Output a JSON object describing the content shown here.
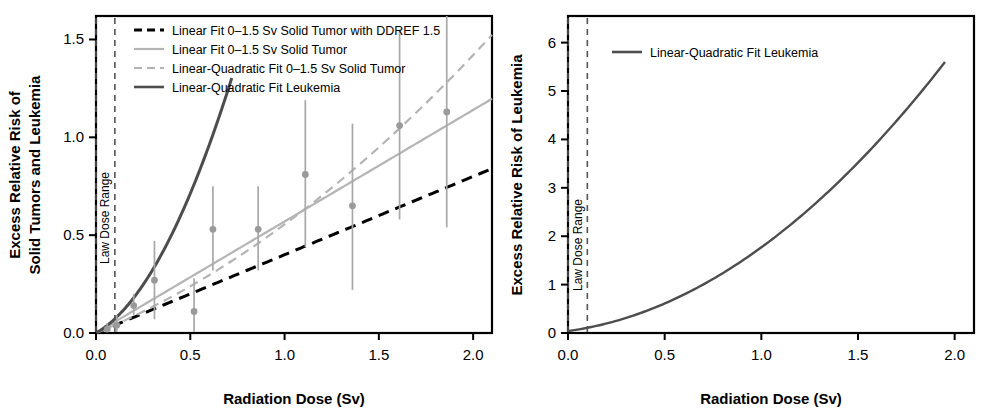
{
  "figure": {
    "width": 992,
    "height": 414,
    "background": "#ffffff",
    "panel_count": 2
  },
  "colors": {
    "axis": "#000000",
    "black_dashed": "#000000",
    "light_gray": "#b4b4b4",
    "dark_gray": "#4d4d4d",
    "point_fill": "#9a9a9a",
    "errorbar": "#a8a8a8",
    "band_dash": "#555555"
  },
  "chart_data": [
    {
      "panel": "left",
      "type": "line",
      "title": "",
      "xlabel": "Radiation Dose (Sv)",
      "ylabel": "Excess Relative Risk of Solid Tumors and Leukemia",
      "ylabel_lines": [
        "Excess Relative Risk of",
        "Solid Tumors and Leukemia"
      ],
      "xlim": [
        0.0,
        2.1
      ],
      "ylim": [
        0.0,
        1.62
      ],
      "xticks": [
        0.0,
        0.5,
        1.0,
        1.5,
        2.0
      ],
      "xticklabels": [
        "0.0",
        "0.5",
        "1.0",
        "1.5",
        "2.0"
      ],
      "yticks": [
        0.0,
        0.5,
        1.0,
        1.5
      ],
      "yticklabels": [
        "0.0",
        "0.5",
        "1.0",
        "1.5"
      ],
      "grid": false,
      "legend_position": "top-left-inside",
      "annotations": [
        {
          "name": "low-dose-range",
          "text": "Law Dose Range",
          "x_start": 0.0,
          "x_end": 0.1,
          "style": "two vertical dashed lines with rotated label between"
        }
      ],
      "series": [
        {
          "name": "Linear Fit 0–1.5 Sv Solid Tumor with DDREF 1.5",
          "style": "dashed",
          "color": "#000000",
          "width": 3.0,
          "model": "linear",
          "slope": 0.4,
          "intercept": 0.0,
          "x_range": [
            0.0,
            2.1
          ],
          "points": [
            [
              0.0,
              0.0
            ],
            [
              0.5,
              0.198
            ],
            [
              1.0,
              0.396
            ],
            [
              1.5,
              0.594
            ],
            [
              2.1,
              0.832
            ]
          ]
        },
        {
          "name": "Linear Fit 0–1.5 Sv Solid Tumor",
          "style": "solid",
          "color": "#b4b4b4",
          "width": 2.2,
          "model": "linear",
          "slope": 0.57,
          "intercept": 0.0,
          "x_range": [
            0.0,
            2.1
          ],
          "points": [
            [
              0.0,
              0.0
            ],
            [
              0.5,
              0.286
            ],
            [
              1.0,
              0.572
            ],
            [
              1.5,
              0.858
            ],
            [
              2.1,
              1.2
            ]
          ]
        },
        {
          "name": "Linear-Quadratic Fit 0–1.5 Sv Solid Tumor",
          "style": "dashed",
          "color": "#b4b4b4",
          "width": 2.2,
          "model": "linear-quadratic",
          "alpha": 0.4,
          "beta": 0.155,
          "x_range": [
            0.0,
            2.1
          ],
          "points": [
            [
              0.0,
              0.0
            ],
            [
              0.5,
              0.239
            ],
            [
              1.0,
              0.555
            ],
            [
              1.5,
              0.949
            ],
            [
              2.1,
              1.523
            ]
          ]
        },
        {
          "name": "Linear-Quadratic Fit Leukemia",
          "style": "solid",
          "color": "#4d4d4d",
          "width": 3.0,
          "model": "linear-quadratic",
          "alpha": 0.55,
          "beta": 1.75,
          "x_range": [
            0.0,
            0.72
          ],
          "points": [
            [
              0.0,
              0.0
            ],
            [
              0.2,
              0.18
            ],
            [
              0.4,
              0.5
            ],
            [
              0.6,
              0.96
            ],
            [
              0.72,
              1.303
            ]
          ]
        }
      ],
      "data_points": {
        "name": "Solid tumor observed ERR with 95% CI",
        "marker": "filled circle",
        "color": "#9a9a9a",
        "x": [
          0.06,
          0.11,
          0.2,
          0.31,
          0.52,
          0.62,
          0.86,
          1.11,
          1.36,
          1.61,
          1.86
        ],
        "y": [
          0.02,
          0.04,
          0.14,
          0.27,
          0.11,
          0.53,
          0.53,
          0.81,
          0.65,
          1.06,
          1.13
        ],
        "y_low": [
          0.0,
          0.0,
          0.09,
          0.07,
          -0.05,
          0.32,
          0.32,
          0.44,
          0.22,
          0.58,
          0.54
        ],
        "y_high": [
          0.05,
          0.09,
          0.2,
          0.47,
          0.28,
          0.75,
          0.75,
          1.19,
          1.07,
          1.55,
          1.73
        ]
      }
    },
    {
      "panel": "right",
      "type": "line",
      "title": "",
      "xlabel": "Radiation Dose (Sv)",
      "ylabel": "Excess Relative Risk of Leukemia",
      "xlim": [
        0.0,
        2.1
      ],
      "ylim": [
        0.0,
        6.55
      ],
      "xticks": [
        0.0,
        0.5,
        1.0,
        1.5,
        2.0
      ],
      "xticklabels": [
        "0.0",
        "0.5",
        "1.0",
        "1.5",
        "2.0"
      ],
      "yticks": [
        0,
        1,
        2,
        3,
        4,
        5,
        6
      ],
      "yticklabels": [
        "0",
        "1",
        "2",
        "3",
        "4",
        "5",
        "6"
      ],
      "grid": false,
      "legend_position": "top-inside",
      "annotations": [
        {
          "name": "low-dose-range",
          "text": "Law Dose Range",
          "x_start": 0.0,
          "x_end": 0.1,
          "style": "two vertical dashed lines with rotated label between"
        }
      ],
      "series": [
        {
          "name": "Linear-Quadratic Fit Leukemia",
          "style": "solid",
          "color": "#4d4d4d",
          "width": 2.4,
          "model": "linear-quadratic",
          "alpha": 0.55,
          "beta": 1.18,
          "x_range": [
            0.0,
            1.95
          ],
          "points": [
            [
              0.0,
              0.04
            ],
            [
              0.25,
              0.25
            ],
            [
              0.5,
              0.58
            ],
            [
              0.75,
              1.05
            ],
            [
              1.0,
              1.73
            ],
            [
              1.25,
              2.68
            ],
            [
              1.5,
              3.52
            ],
            [
              1.75,
              4.55
            ],
            [
              1.95,
              5.58
            ]
          ]
        }
      ]
    }
  ],
  "left_panel": {
    "legend": {
      "items": [
        {
          "label": "Linear Fit 0–1.5 Sv Solid Tumor with DDREF 1.5",
          "style": "dashed",
          "color": "#000000"
        },
        {
          "label": "Linear Fit 0–1.5 Sv Solid Tumor",
          "style": "solid",
          "color": "#b4b4b4"
        },
        {
          "label": "Linear-Quadratic Fit 0–1.5 Sv Solid Tumor",
          "style": "dashed",
          "color": "#b4b4b4"
        },
        {
          "label": "Linear-Quadratic Fit Leukemia",
          "style": "solid",
          "color": "#4d4d4d"
        }
      ]
    },
    "band_label": "Law Dose Range",
    "xlabel": "Radiation Dose (Sv)",
    "ylabel_line1": "Excess Relative Risk of",
    "ylabel_line2": "Solid Tumors and Leukemia",
    "xticklabels": [
      "0.0",
      "0.5",
      "1.0",
      "1.5",
      "2.0"
    ],
    "yticklabels": [
      "0.0",
      "0.5",
      "1.0",
      "1.5"
    ]
  },
  "right_panel": {
    "legend": {
      "items": [
        {
          "label": "Linear-Quadratic Fit Leukemia",
          "style": "solid",
          "color": "#4d4d4d"
        }
      ]
    },
    "band_label": "Law Dose Range",
    "xlabel": "Radiation Dose (Sv)",
    "ylabel": "Excess Relative Risk of Leukemia",
    "xticklabels": [
      "0.0",
      "0.5",
      "1.0",
      "1.5",
      "2.0"
    ],
    "yticklabels": [
      "0",
      "1",
      "2",
      "3",
      "4",
      "5",
      "6"
    ]
  }
}
